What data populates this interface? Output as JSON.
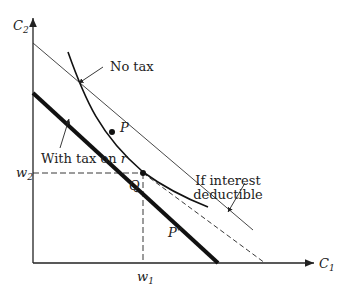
{
  "diagram": {
    "type": "intertemporal-budget-constraint",
    "axes": {
      "x_label": "C",
      "x_label_sub": "1",
      "y_label": "C",
      "y_label_sub": "2"
    },
    "tick_labels": {
      "w1": "w",
      "w1_sub": "1",
      "w2": "w",
      "w2_sub": "2"
    },
    "points": {
      "P": "P",
      "Q": "Q",
      "P2": "P\""
    },
    "annotations": {
      "no_tax": "No tax",
      "with_tax": "With tax on ",
      "with_tax_var": "r",
      "deductible_line1": "If interest",
      "deductible_line2": "deductible"
    },
    "colors": {
      "ink": "#222222",
      "background": "#ffffff"
    }
  }
}
